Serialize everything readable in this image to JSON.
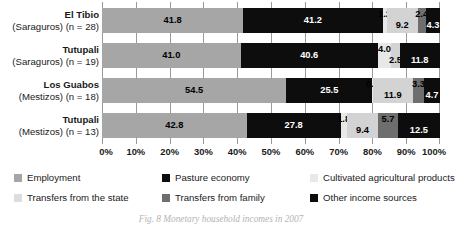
{
  "chart_data": {
    "type": "bar",
    "orientation": "horizontal",
    "stacked": true,
    "title": "",
    "xlabel": "",
    "ylabel": "",
    "xlim": [
      0,
      100
    ],
    "grid": true,
    "legend_position": "bottom",
    "categories": [
      "El Tibio (Saraguros) (n = 28)",
      "Tutupali (Saraguros) (n = 19)",
      "Los Guabos (Mestizos) (n = 18)",
      "Tutupali (Mestizos) (n = 13)"
    ],
    "category_labels": [
      {
        "name": "El Tibio",
        "sub": "(Saraguros) (n = 28)"
      },
      {
        "name": "Tutupali",
        "sub": "(Saraguros) (n = 19)"
      },
      {
        "name": "Los Guabos",
        "sub": "(Mestizos) (n = 18)"
      },
      {
        "name": "Tutupali",
        "sub": "(Mestizos) (n = 13)"
      }
    ],
    "series": [
      {
        "name": "Employment",
        "color": "#a6a6a6",
        "label_color": "#000000",
        "values": [
          41.8,
          41.0,
          54.5,
          42.8
        ]
      },
      {
        "name": "Pasture economy",
        "color": "#0d0d0d",
        "label_color": "#ffffff",
        "values": [
          41.2,
          40.6,
          25.5,
          27.8
        ]
      },
      {
        "name": "Cultivated agricultural products",
        "color": "#e8e8e8",
        "label_color": "#000000",
        "values": [
          1.2,
          4.0,
          0.1,
          1.8
        ]
      },
      {
        "name": "Transfers from the state",
        "color": "#d3d3d3",
        "label_color": "#000000",
        "values": [
          9.2,
          2.5,
          11.9,
          9.4
        ]
      },
      {
        "name": "Transfers from family",
        "color": "#6e6e6e",
        "label_color": "#000000",
        "values": [
          2.4,
          0.0,
          3.3,
          5.7
        ]
      },
      {
        "name": "Other income sources",
        "color": "#0d0d0d",
        "label_color": "#ffffff",
        "values": [
          4.3,
          11.8,
          4.7,
          12.5
        ]
      }
    ],
    "xticks": [
      "0%",
      "10%",
      "20%",
      "30%",
      "40%",
      "50%",
      "60%",
      "70%",
      "80%",
      "90%",
      "100%"
    ],
    "xtick_values": [
      0,
      10,
      20,
      30,
      40,
      50,
      60,
      70,
      80,
      90,
      100
    ],
    "bar_value_labels": [
      [
        "41.8",
        "41.2",
        "1.2",
        "9.2",
        "2.4",
        "4.3"
      ],
      [
        "41.0",
        "40.6",
        "4.0",
        "2.5",
        "",
        "11.8"
      ],
      [
        "54.5",
        "25.5",
        "0.1",
        "11.9",
        "3.3",
        "4.7"
      ],
      [
        "42.8",
        "27.8",
        "1.8",
        "9.4",
        "5.7",
        "12.5"
      ]
    ]
  },
  "legend": {
    "items": [
      {
        "label": "Employment",
        "color": "#a6a6a6"
      },
      {
        "label": "Pasture economy",
        "color": "#0d0d0d"
      },
      {
        "label": "Cultivated agricultural products",
        "color": "#e8e8e8"
      },
      {
        "label": "Transfers from the state",
        "color": "#dcdcdc"
      },
      {
        "label": "Transfers from family",
        "color": "#6e6e6e"
      },
      {
        "label": "Other income sources",
        "color": "#0d0d0d"
      }
    ]
  },
  "caption": "Fig. 8  Monetary household incomes in 2007"
}
